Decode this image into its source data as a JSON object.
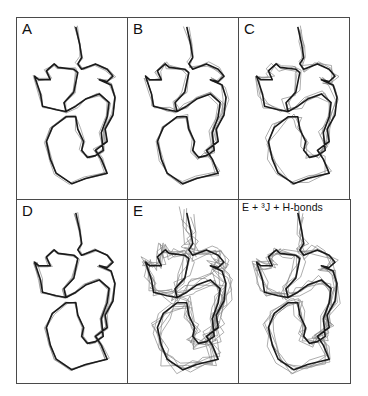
{
  "figure": {
    "type": "protein-backbone-superposition-grid",
    "layout": {
      "rows": 2,
      "cols": 3
    },
    "panels": [
      {
        "id": "A",
        "label": "A",
        "overlay_spread": 2
      },
      {
        "id": "B",
        "label": "B",
        "overlay_spread": 3
      },
      {
        "id": "C",
        "label": "C",
        "overlay_spread": 5
      },
      {
        "id": "D",
        "label": "D",
        "overlay_spread": 1.5
      },
      {
        "id": "E",
        "label": "E",
        "overlay_spread": 9
      },
      {
        "id": "F",
        "label": "E + ³J + H-bonds",
        "overlay_spread": 6
      }
    ],
    "colors": {
      "frame": "#4a4a4a",
      "main_trace": "#1a1a1a",
      "overlay_trace": "#8a8a8a",
      "background": "#ffffff"
    }
  }
}
